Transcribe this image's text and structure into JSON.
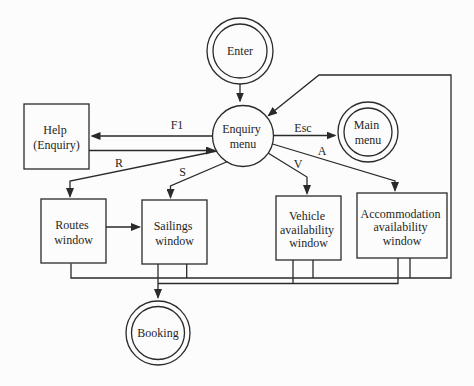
{
  "diagram": {
    "type": "state-transition-diagram",
    "colors": {
      "background": "#fcfcfc",
      "line": "#2a2a2a",
      "text": "#1f1f1f"
    },
    "nodes": {
      "enter": {
        "shape": "double-circle",
        "lines": [
          "Enter"
        ]
      },
      "enquiry_menu": {
        "shape": "circle",
        "lines": [
          "Enquiry",
          "menu"
        ]
      },
      "main_menu": {
        "shape": "double-circle",
        "lines": [
          "Main",
          "menu"
        ]
      },
      "help": {
        "shape": "rectangle",
        "lines": [
          "Help",
          "(Enquiry)"
        ]
      },
      "routes": {
        "shape": "rectangle",
        "lines": [
          "Routes",
          "window"
        ]
      },
      "sailings": {
        "shape": "rectangle",
        "lines": [
          "Sailings",
          "window"
        ]
      },
      "vehicle": {
        "shape": "rectangle",
        "lines": [
          "Vehicle",
          "availability",
          "window"
        ]
      },
      "accommodation": {
        "shape": "rectangle",
        "lines": [
          "Accommodation",
          "availability",
          "window"
        ]
      },
      "booking": {
        "shape": "double-circle",
        "lines": [
          "Booking"
        ]
      }
    },
    "edge_labels": {
      "f1": "F1",
      "r": "R",
      "s": "S",
      "v": "V",
      "a": "A",
      "esc": "Esc"
    }
  }
}
